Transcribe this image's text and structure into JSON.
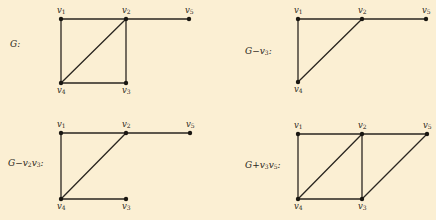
{
  "figure": {
    "background": "#fbefd3",
    "ink": "#2a2620"
  },
  "panels": [
    {
      "id": "G",
      "label": "G:",
      "label_pos": [
        10,
        40
      ],
      "vertices": [
        {
          "name": "v1",
          "text": "v",
          "sub": "1",
          "x": 61,
          "y": 19,
          "label_dx": -4,
          "label_dy": -13
        },
        {
          "name": "v2",
          "text": "v",
          "sub": "2",
          "x": 126,
          "y": 19,
          "label_dx": -4,
          "label_dy": -13
        },
        {
          "name": "v5",
          "text": "v",
          "sub": "5",
          "x": 189,
          "y": 19,
          "label_dx": -4,
          "label_dy": -13
        },
        {
          "name": "v4",
          "text": "v",
          "sub": "4",
          "x": 61,
          "y": 83,
          "label_dx": -4,
          "label_dy": 3
        },
        {
          "name": "v3",
          "text": "v",
          "sub": "3",
          "x": 126,
          "y": 83,
          "label_dx": -4,
          "label_dy": 3
        }
      ],
      "edges": [
        [
          "v1",
          "v2"
        ],
        [
          "v2",
          "v5"
        ],
        [
          "v1",
          "v4"
        ],
        [
          "v2",
          "v4"
        ],
        [
          "v2",
          "v3"
        ],
        [
          "v4",
          "v3"
        ]
      ]
    },
    {
      "id": "G-v3",
      "label": "G−v",
      "label_sub": "3",
      "label_tail": ":",
      "label_pos": [
        245,
        47
      ],
      "vertices": [
        {
          "name": "v1",
          "text": "v",
          "sub": "1",
          "x": 298,
          "y": 19,
          "label_dx": -4,
          "label_dy": -13
        },
        {
          "name": "v2",
          "text": "v",
          "sub": "2",
          "x": 362,
          "y": 19,
          "label_dx": -4,
          "label_dy": -13
        },
        {
          "name": "v5",
          "text": "v",
          "sub": "5",
          "x": 426,
          "y": 19,
          "label_dx": -4,
          "label_dy": -13
        },
        {
          "name": "v4",
          "text": "v",
          "sub": "4",
          "x": 298,
          "y": 82,
          "label_dx": -4,
          "label_dy": 3
        }
      ],
      "edges": [
        [
          "v1",
          "v2"
        ],
        [
          "v2",
          "v5"
        ],
        [
          "v1",
          "v4"
        ],
        [
          "v2",
          "v4"
        ]
      ]
    },
    {
      "id": "G-v2v3",
      "label": "G−v",
      "label_sub": "2",
      "label_mid": "v",
      "label_sub2": "3",
      "label_tail": ":",
      "label_pos": [
        8,
        159
      ],
      "vertices": [
        {
          "name": "v1",
          "text": "v",
          "sub": "1",
          "x": 61,
          "y": 133,
          "label_dx": -4,
          "label_dy": -13
        },
        {
          "name": "v2",
          "text": "v",
          "sub": "2",
          "x": 126,
          "y": 133,
          "label_dx": -4,
          "label_dy": -13
        },
        {
          "name": "v5",
          "text": "v",
          "sub": "5",
          "x": 190,
          "y": 133,
          "label_dx": -4,
          "label_dy": -13
        },
        {
          "name": "v4",
          "text": "v",
          "sub": "4",
          "x": 61,
          "y": 199,
          "label_dx": -4,
          "label_dy": 3
        },
        {
          "name": "v3",
          "text": "v",
          "sub": "3",
          "x": 126,
          "y": 199,
          "label_dx": -4,
          "label_dy": 3
        }
      ],
      "edges": [
        [
          "v1",
          "v2"
        ],
        [
          "v2",
          "v5"
        ],
        [
          "v1",
          "v4"
        ],
        [
          "v2",
          "v4"
        ],
        [
          "v4",
          "v3"
        ]
      ]
    },
    {
      "id": "G+v3v5",
      "label": "G+v",
      "label_sub": "3",
      "label_mid": "v",
      "label_sub2": "5",
      "label_tail": ":",
      "label_pos": [
        245,
        161
      ],
      "vertices": [
        {
          "name": "v1",
          "text": "v",
          "sub": "1",
          "x": 298,
          "y": 134,
          "label_dx": -4,
          "label_dy": -13
        },
        {
          "name": "v2",
          "text": "v",
          "sub": "2",
          "x": 362,
          "y": 134,
          "label_dx": -4,
          "label_dy": -13
        },
        {
          "name": "v5",
          "text": "v",
          "sub": "5",
          "x": 427,
          "y": 134,
          "label_dx": -4,
          "label_dy": -13
        },
        {
          "name": "v4",
          "text": "v",
          "sub": "4",
          "x": 298,
          "y": 199,
          "label_dx": -4,
          "label_dy": 3
        },
        {
          "name": "v3",
          "text": "v",
          "sub": "3",
          "x": 362,
          "y": 199,
          "label_dx": -4,
          "label_dy": 3
        }
      ],
      "edges": [
        [
          "v1",
          "v2"
        ],
        [
          "v2",
          "v5"
        ],
        [
          "v1",
          "v4"
        ],
        [
          "v2",
          "v4"
        ],
        [
          "v2",
          "v3"
        ],
        [
          "v4",
          "v3"
        ],
        [
          "v3",
          "v5"
        ]
      ]
    }
  ]
}
